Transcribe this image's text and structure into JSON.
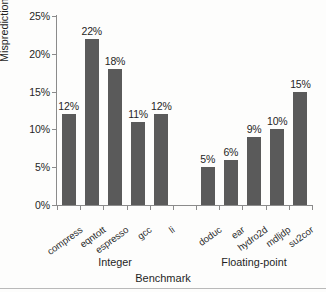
{
  "chart_data": {
    "type": "bar",
    "title": "",
    "xlabel": "Benchmark",
    "ylabel": "Misprediction rate",
    "categories": [
      "compress",
      "eqntott",
      "espresso",
      "gcc",
      "li",
      "doduc",
      "ear",
      "hydro2d",
      "mdljdp",
      "su2cor"
    ],
    "values": [
      12,
      22,
      18,
      11,
      12,
      5,
      6,
      9,
      10,
      15
    ],
    "value_labels": [
      "12%",
      "22%",
      "18%",
      "11%",
      "12%",
      "5%",
      "6%",
      "9%",
      "10%",
      "15%"
    ],
    "ylim": [
      0,
      25
    ],
    "ytick_labels": [
      "0%",
      "5%",
      "10%",
      "15%",
      "20%",
      "25%"
    ],
    "ytick_values": [
      0,
      5,
      10,
      15,
      20,
      25
    ],
    "grid": false,
    "legend": "none",
    "groups": [
      {
        "label": "Integer",
        "members": [
          "compress",
          "eqntott",
          "espresso",
          "gcc",
          "li"
        ]
      },
      {
        "label": "Floating-point",
        "members": [
          "doduc",
          "ear",
          "hydro2d",
          "mdljdp",
          "su2cor"
        ]
      }
    ],
    "bar_color": "#5a5a5a",
    "axis_color": "#8b8b8b",
    "background_color": "#fdfdfc"
  }
}
